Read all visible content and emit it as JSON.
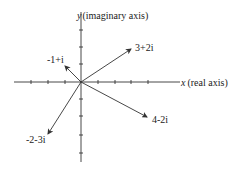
{
  "diagram": {
    "axes": {
      "x_label_var": "x",
      "x_label_text": "(real axis)",
      "y_label_var": "y",
      "y_label_text": "(imaginary axis)",
      "x_ticks": [
        -4,
        -3,
        -2,
        -1,
        1,
        2,
        3,
        4
      ],
      "y_ticks": [
        -4,
        -3,
        -2,
        -1,
        1,
        2,
        3
      ]
    },
    "vectors": [
      {
        "label": "3+2i",
        "re": 3,
        "im": 2
      },
      {
        "label": "-1+i",
        "re": -1,
        "im": 1
      },
      {
        "label": "4-2i",
        "re": 4,
        "im": -2
      },
      {
        "label": "-2-3i",
        "re": -2,
        "im": -3
      }
    ],
    "colors": {
      "line": "#333333",
      "text": "#222222",
      "background": "#ffffff"
    }
  }
}
